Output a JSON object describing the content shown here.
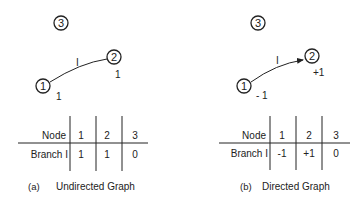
{
  "panels": [
    {
      "id": "a",
      "caption_letter": "(a)",
      "caption": "Undirected Graph",
      "nodes": [
        {
          "label": "1"
        },
        {
          "label": "2"
        },
        {
          "label": "3"
        }
      ],
      "branch_label": "I",
      "node_values": {
        "n1": "1",
        "n2": "1"
      },
      "table": {
        "header_label": "Node",
        "columns": [
          "1",
          "2",
          "3"
        ],
        "row_label": "Branch I",
        "row_values": [
          "1",
          "1",
          "0"
        ]
      }
    },
    {
      "id": "b",
      "caption_letter": "(b)",
      "caption": "Directed Graph",
      "nodes": [
        {
          "label": "1"
        },
        {
          "label": "2"
        },
        {
          "label": "3"
        }
      ],
      "branch_label": "I",
      "node_values": {
        "n1": "- 1",
        "n2": "+1"
      },
      "table": {
        "header_label": "Node",
        "columns": [
          "1",
          "2",
          "3"
        ],
        "row_label": "Branch I",
        "row_values": [
          "-1",
          "+1",
          "0"
        ]
      }
    }
  ]
}
